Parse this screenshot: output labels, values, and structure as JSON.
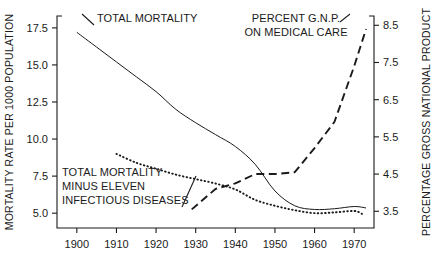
{
  "chart_data": {
    "type": "line",
    "title": "",
    "xlabel": "",
    "ylabel": "MORTALITY RATE PER 1000 POPULATION",
    "y2label": "PERCENTAGE GROSS NATIONAL PRODUCT",
    "grid": false,
    "legend_position": "inline-annotations",
    "xlim": [
      1895,
      1975
    ],
    "ylim": [
      4.0,
      18.3
    ],
    "y2lim": [
      3.05,
      8.75
    ],
    "xticks": [
      1900,
      1910,
      1920,
      1930,
      1940,
      1950,
      1960,
      1970
    ],
    "xticklabels": [
      "1900",
      "1910",
      "1920",
      "1930",
      "1940",
      "1950",
      "1960",
      "1970"
    ],
    "yticks": [
      5.0,
      7.5,
      10.0,
      12.5,
      15.0,
      17.5
    ],
    "yticklabels": [
      "5.0",
      "7.5",
      "10.0",
      "12.5",
      "15.0",
      "17.5"
    ],
    "y2ticks": [
      3.5,
      4.5,
      5.5,
      6.5,
      7.5,
      8.5
    ],
    "y2ticklabels": [
      "3.5",
      "4.5",
      "5.5",
      "6.5",
      "7.5",
      "8.5"
    ],
    "series": [
      {
        "name": "TOTAL MORTALITY",
        "style": "solid",
        "axis": "left",
        "label_lines": [
          "TOTAL MORTALITY"
        ],
        "x": [
          1900,
          1905,
          1910,
          1915,
          1920,
          1925,
          1930,
          1935,
          1940,
          1945,
          1950,
          1955,
          1960,
          1965,
          1970,
          1973
        ],
        "values": [
          17.2,
          16.2,
          15.2,
          14.2,
          13.2,
          12.0,
          11.1,
          10.3,
          9.5,
          8.3,
          6.5,
          5.5,
          5.25,
          5.3,
          5.45,
          5.35
        ]
      },
      {
        "name": "TOTAL MORTALITY MINUS ELEVEN INFECTIOUS DISEASES",
        "style": "dotted",
        "axis": "left",
        "label_lines": [
          "TOTAL MORTALITY",
          "MINUS ELEVEN",
          "INFECTIOUS DISEASES"
        ],
        "x": [
          1910,
          1915,
          1920,
          1925,
          1930,
          1935,
          1940,
          1945,
          1950,
          1955,
          1960,
          1965,
          1970,
          1972
        ],
        "values": [
          9.0,
          8.4,
          8.0,
          7.6,
          7.3,
          7.0,
          6.6,
          5.9,
          5.5,
          5.2,
          5.0,
          5.05,
          5.15,
          4.95
        ]
      },
      {
        "name": "PERCENT G.N.P. ON MEDICAL CARE",
        "style": "dashed",
        "axis": "right",
        "label_lines": [
          "PERCENT G.N.P.",
          "ON MEDICAL CARE"
        ],
        "x": [
          1929,
          1935,
          1940,
          1945,
          1950,
          1955,
          1960,
          1965,
          1970,
          1973
        ],
        "values": [
          3.55,
          4.1,
          4.25,
          4.5,
          4.5,
          4.55,
          5.2,
          5.9,
          7.4,
          8.4
        ]
      }
    ]
  },
  "annotations": {
    "total_mortality": "TOTAL MORTALITY",
    "minus_infectious_1": "TOTAL MORTALITY",
    "minus_infectious_2": "MINUS ELEVEN",
    "minus_infectious_3": "INFECTIOUS DISEASES",
    "gnp_1": "PERCENT G.N.P.",
    "gnp_2": "ON MEDICAL CARE"
  },
  "axes": {
    "left_title": "MORTALITY RATE PER 1000 POPULATION",
    "right_title": "PERCENTAGE GROSS NATIONAL PRODUCT"
  },
  "colors": {
    "ink": "#1a1a1a",
    "background": "#ffffff"
  }
}
